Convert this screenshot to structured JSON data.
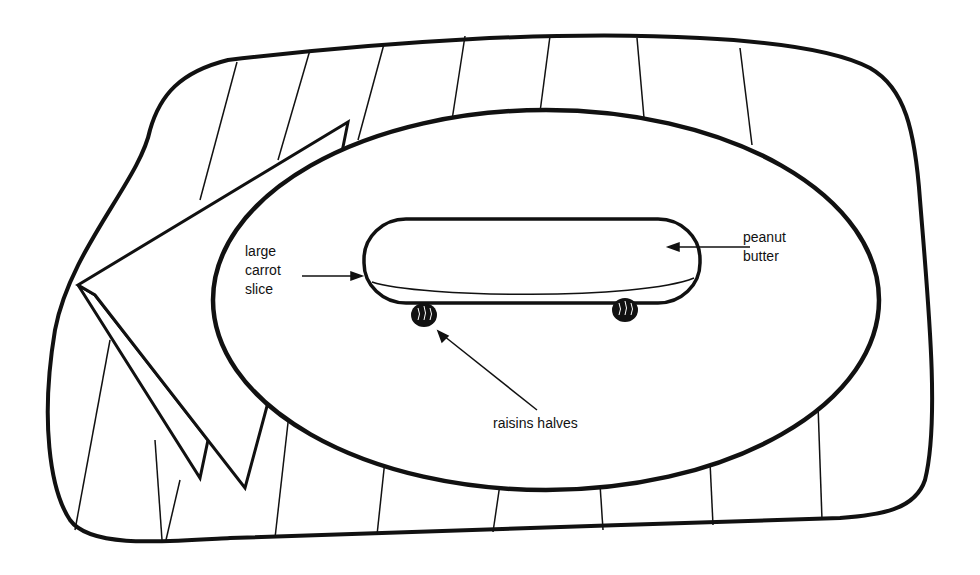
{
  "illustration": {
    "subject": "skateboard snack on a plate over a striped placemat with folded napkin",
    "colors": {
      "ink": "#111111",
      "paper": "#ffffff"
    }
  },
  "labels": {
    "carrot": "large\ncarrot\nslice",
    "peanut_butter": "peanut\nbutter",
    "raisins": "raisins halves"
  }
}
